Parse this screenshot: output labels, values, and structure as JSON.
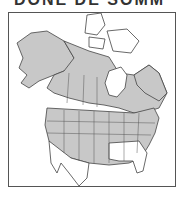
{
  "title": "DONE DE SOMM",
  "map": {
    "region": "North America",
    "range_color": "#c8c8c8",
    "land_color": "#ffffff",
    "border_color": "#444444"
  }
}
